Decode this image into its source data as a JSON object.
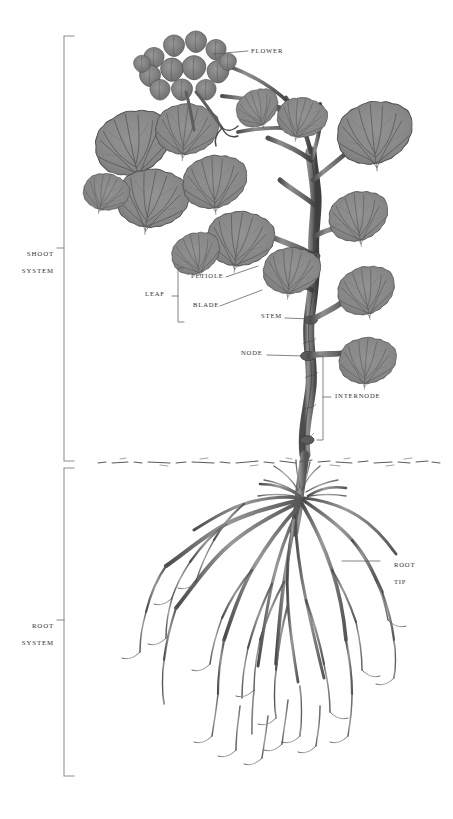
{
  "figure": {
    "name": "plant-body-structure-diagram",
    "background_color": "#ffffff",
    "ink_color": "#3a3a3a",
    "foliage_fill": "#8b8b8b",
    "foliage_stroke": "#4a4a4a",
    "flower_fill": "#7e7e7e",
    "stem_fill": "#6f6f6f",
    "root_color": "#5c5c5c",
    "leader_color": "#5d5a58",
    "bracket_color": "#8d8d8d"
  },
  "system_brackets": [
    {
      "id": "shoot",
      "label_line_1": "SHOOT",
      "label_line_2": "SYSTEM",
      "top": 36,
      "bottom": 461,
      "tick_y": 248
    },
    {
      "id": "root",
      "label_line_1": "ROOT",
      "label_line_2": "SYSTEM",
      "top": 468,
      "bottom": 776,
      "tick_y": 620
    }
  ],
  "callouts": [
    {
      "id": "flower",
      "label": "FLOWER",
      "x": 251,
      "y": 50,
      "leader_to_x": 214,
      "leader_to_y": 54
    },
    {
      "id": "petiole",
      "label": "PETIOLE",
      "x": 191,
      "y": 279,
      "leader_to_x": 258,
      "leader_to_y": 268
    },
    {
      "id": "blade",
      "label": "BLADE",
      "x": 193,
      "y": 308,
      "leader_to_x": 262,
      "leader_to_y": 292
    },
    {
      "id": "leaf",
      "label": "LEAF",
      "x": 148,
      "y": 294,
      "leader_to_x": 178,
      "leader_to_y": 296
    },
    {
      "id": "stem",
      "label": "STEM",
      "x": 264,
      "y": 316,
      "leader_to_x": 313,
      "leader_to_y": 319
    },
    {
      "id": "node",
      "label": "NODE",
      "x": 243,
      "y": 353,
      "leader_to_x": 305,
      "leader_to_y": 356
    },
    {
      "id": "internode",
      "label": "INTERNODE",
      "x": 335,
      "y": 396,
      "leader_to_x": 323,
      "leader_to_y": 397
    },
    {
      "id": "root-tip",
      "label_line_1": "ROOT",
      "label_line_2": "TIP",
      "x": 384,
      "y": 557,
      "leader_to_x": 343,
      "leader_to_y": 562
    }
  ],
  "leaf_bracket": {
    "x": 178,
    "top": 268,
    "bottom": 322,
    "tick_y": 296
  },
  "internode_bracket": {
    "x": 323,
    "top": 356,
    "bottom": 440,
    "tick_y": 397
  },
  "soil_line": {
    "y": 462,
    "x_start": 96,
    "x_end": 440,
    "style": "broken-ground-line"
  }
}
